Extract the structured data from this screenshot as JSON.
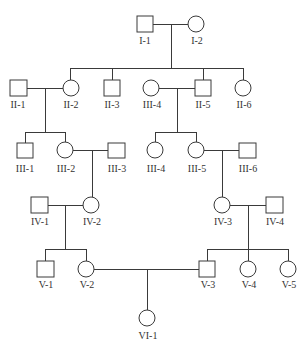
{
  "diagram": {
    "type": "pedigree-chart",
    "generations": [
      "I",
      "II",
      "III",
      "IV",
      "V",
      "VI"
    ],
    "individuals": [
      {
        "id": "I-1",
        "label": "I-1",
        "sex": "male",
        "generation": 1
      },
      {
        "id": "I-2",
        "label": "I-2",
        "sex": "female",
        "generation": 1
      },
      {
        "id": "II-1",
        "label": "II-1",
        "sex": "male",
        "generation": 2
      },
      {
        "id": "II-2",
        "label": "II-2",
        "sex": "female",
        "generation": 2
      },
      {
        "id": "II-3",
        "label": "II-3",
        "sex": "male",
        "generation": 2
      },
      {
        "id": "II-4",
        "label": "III-4",
        "sex": "female",
        "generation": 2
      },
      {
        "id": "II-5",
        "label": "II-5",
        "sex": "male",
        "generation": 2
      },
      {
        "id": "II-6",
        "label": "II-6",
        "sex": "female",
        "generation": 2
      },
      {
        "id": "III-1",
        "label": "III-1",
        "sex": "male",
        "generation": 3
      },
      {
        "id": "III-2",
        "label": "III-2",
        "sex": "female",
        "generation": 3
      },
      {
        "id": "III-3",
        "label": "III-3",
        "sex": "male",
        "generation": 3
      },
      {
        "id": "III-4",
        "label": "III-4",
        "sex": "female",
        "generation": 3
      },
      {
        "id": "III-5",
        "label": "III-5",
        "sex": "female",
        "generation": 3
      },
      {
        "id": "III-6",
        "label": "III-6",
        "sex": "male",
        "generation": 3
      },
      {
        "id": "IV-1",
        "label": "IV-1",
        "sex": "male",
        "generation": 4
      },
      {
        "id": "IV-2",
        "label": "IV-2",
        "sex": "female",
        "generation": 4
      },
      {
        "id": "IV-3",
        "label": "IV-3",
        "sex": "female",
        "generation": 4
      },
      {
        "id": "IV-4",
        "label": "IV-4",
        "sex": "male",
        "generation": 4
      },
      {
        "id": "V-1",
        "label": "V-1",
        "sex": "male",
        "generation": 5
      },
      {
        "id": "V-2",
        "label": "V-2",
        "sex": "female",
        "generation": 5
      },
      {
        "id": "V-3",
        "label": "V-3",
        "sex": "male",
        "generation": 5
      },
      {
        "id": "V-4",
        "label": "V-4",
        "sex": "female",
        "generation": 5
      },
      {
        "id": "V-5",
        "label": "V-5",
        "sex": "female",
        "generation": 5
      },
      {
        "id": "VI-1",
        "label": "VI-1",
        "sex": "female",
        "generation": 6
      }
    ],
    "couples": [
      {
        "partners": [
          "I-1",
          "I-2"
        ],
        "children": [
          "II-2",
          "II-3",
          "II-5",
          "II-6"
        ]
      },
      {
        "partners": [
          "II-1",
          "II-2"
        ],
        "children": [
          "III-1",
          "III-2"
        ]
      },
      {
        "partners": [
          "II-4",
          "II-5"
        ],
        "children": [
          "III-4",
          "III-5"
        ]
      },
      {
        "partners": [
          "III-2",
          "III-3"
        ],
        "children": [
          "IV-2"
        ]
      },
      {
        "partners": [
          "III-5",
          "III-6"
        ],
        "children": [
          "IV-3"
        ]
      },
      {
        "partners": [
          "IV-1",
          "IV-2"
        ],
        "children": [
          "V-1",
          "V-2"
        ]
      },
      {
        "partners": [
          "IV-3",
          "IV-4"
        ],
        "children": [
          "V-3",
          "V-4",
          "V-5"
        ]
      },
      {
        "partners": [
          "V-2",
          "V-3"
        ],
        "children": [
          "VI-1"
        ]
      }
    ],
    "legend": {
      "square": "male",
      "circle": "female",
      "all_unaffected_shading": "none (all symbols unfilled)"
    }
  },
  "labels": {
    "I1": "I-1",
    "I2": "I-2",
    "II1": "II-1",
    "II2": "II-2",
    "II3": "II-3",
    "II4": "III-4",
    "II5": "II-5",
    "II6": "II-6",
    "III1": "III-1",
    "III2": "III-2",
    "III3": "III-3",
    "III4": "III-4",
    "III5": "III-5",
    "III6": "III-6",
    "IV1": "IV-1",
    "IV2": "IV-2",
    "IV3": "IV-3",
    "IV4": "IV-4",
    "V1": "V-1",
    "V2": "V-2",
    "V3": "V-3",
    "V4": "V-4",
    "V5": "V-5",
    "VI1": "VI-1"
  },
  "colors": {
    "line": "#3a3a3a",
    "background": "#ffffff",
    "symbol_fill": "#ffffff"
  }
}
